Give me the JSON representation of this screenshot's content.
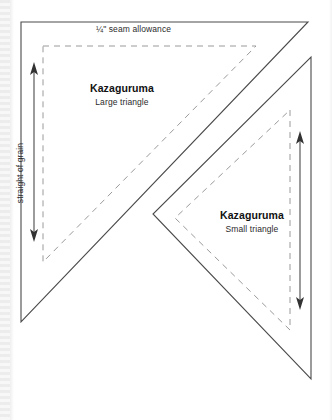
{
  "page": {
    "background_color": "#ffffff",
    "line_color": "#4a4a4a",
    "seam_line_color": "#9a9a9a",
    "width": 332,
    "height": 420
  },
  "annotations": {
    "seam_allowance_label": "¼\" seam allowance",
    "grain_label": "straight of grain"
  },
  "pieces": [
    {
      "id": "large-triangle",
      "title": "Kazaguruma",
      "subtitle": "Large triangle",
      "cut_points": "21,22 308,22 21,322",
      "seam_points": "43,46 256,46 43,262"
    },
    {
      "id": "small-triangle",
      "title": "Kazaguruma",
      "subtitle": "Small triangle",
      "cut_points": "311,57 311,379 153,214",
      "seam_points": "290,110 290,330 175,218"
    }
  ],
  "grain_arrows": [
    {
      "id": "large-triangle-grain-arrow",
      "x": 34,
      "y_top": 64,
      "y_bottom": 240
    },
    {
      "id": "small-triangle-grain-arrow",
      "x": 300,
      "y_top": 133,
      "y_bottom": 308
    }
  ]
}
